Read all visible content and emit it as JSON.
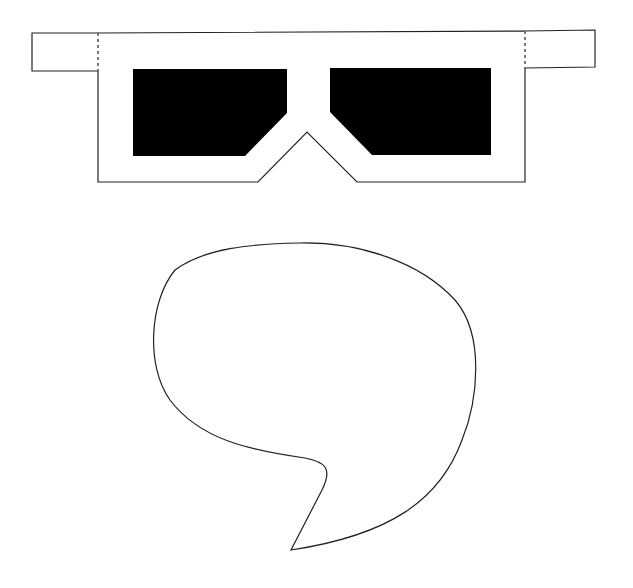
{
  "drawing": {
    "background": "#ffffff",
    "stroke": "#222222",
    "fill_dark": "#000000",
    "glasses": {
      "label": "3D glasses cutout template",
      "left_arm": "32,33 98,33 98,71 32,71",
      "right_arm": "525,31 595,30 595,67 525,68",
      "frame": "98,33 525,31 525,182 357,182 307,132 258,182 98,182",
      "left_lens": "133,69 287,69 287,113 245,156 133,156",
      "right_lens": "330,68 491,68 491,155 372,155 330,112",
      "fold_line_left": "98,33 98,71",
      "fold_line_right": "525,31 525,68"
    },
    "speech_bubble": {
      "label": "speech bubble outline",
      "path": "M 300 243 C 360 242 420 262 455 300 C 485 335 478 400 462 440 C 440 500 390 535 291 550 L 322 490 C 333 468 325 462 305 458 C 250 450 200 440 170 400 C 145 365 150 300 175 270 C 205 248 250 244 300 243 Z"
    }
  }
}
